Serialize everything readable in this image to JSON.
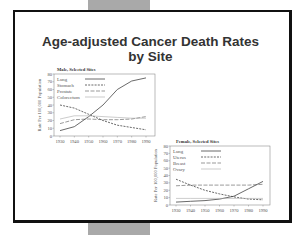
{
  "slide": {
    "title_line1": "Age-adjusted Cancer Death Rates",
    "title_line2": "by Site"
  },
  "colors": {
    "frame": "#111111",
    "grey_bar": "#a9a9a9",
    "line": "#555555",
    "light_line": "#aaaaaa"
  },
  "chart_data": [
    {
      "type": "line",
      "title": "Male, Selected Sites",
      "xlabel": "",
      "ylabel": "Rate Per 100,000 Population",
      "x": [
        1930,
        1940,
        1950,
        1960,
        1970,
        1980,
        1990
      ],
      "xticks": [
        "1930",
        "1940",
        "1950",
        "1960",
        "1970",
        "1980",
        "1990"
      ],
      "yticks": [
        "0",
        "10",
        "20",
        "30",
        "40",
        "50",
        "60",
        "70",
        "80"
      ],
      "ylim": [
        0,
        80
      ],
      "legend_position": "upper left",
      "grid": false,
      "series": [
        {
          "name": "Lung",
          "style": "solid",
          "values": [
            7,
            12,
            25,
            40,
            60,
            71,
            75
          ]
        },
        {
          "name": "Stomach",
          "style": "dashed",
          "values": [
            40,
            36,
            28,
            20,
            14,
            11,
            8
          ]
        },
        {
          "name": "Prostate",
          "style": "long-dash",
          "values": [
            16,
            21,
            22,
            21,
            21,
            22,
            25
          ]
        },
        {
          "name": "Colorectum",
          "style": "light-solid",
          "values": [
            22,
            26,
            26,
            25,
            24,
            23,
            23
          ]
        }
      ]
    },
    {
      "type": "line",
      "title": "Female, Selected Sites",
      "xlabel": "",
      "ylabel": "Rate Per 100,000 Population",
      "x": [
        1930,
        1940,
        1950,
        1960,
        1970,
        1980,
        1990
      ],
      "xticks": [
        "1930",
        "1940",
        "1950",
        "1960",
        "1970",
        "1980",
        "1990"
      ],
      "yticks": [
        "0",
        "10",
        "20",
        "30",
        "40",
        "50",
        "60",
        "70",
        "80"
      ],
      "ylim": [
        0,
        80
      ],
      "legend_position": "upper left",
      "grid": false,
      "series": [
        {
          "name": "Lung",
          "style": "solid",
          "values": [
            4,
            5,
            6,
            8,
            12,
            22,
            32
          ]
        },
        {
          "name": "Uterus",
          "style": "dashed",
          "values": [
            35,
            27,
            20,
            15,
            11,
            8,
            7
          ]
        },
        {
          "name": "Breast",
          "style": "long-dash",
          "values": [
            26,
            27,
            27,
            27,
            27,
            27,
            28
          ]
        },
        {
          "name": "Ovary",
          "style": "light-solid",
          "values": [
            9,
            9,
            9,
            9,
            9,
            9,
            9
          ]
        }
      ]
    }
  ]
}
